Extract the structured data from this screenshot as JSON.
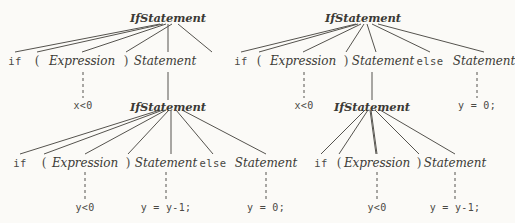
{
  "figure": {
    "background_color": "#fbfaf7",
    "ink_color": "#3b3a36",
    "line_color": "#55534e"
  },
  "trees": [
    {
      "id": "left-tree",
      "nodes": {
        "root": "IfStatement",
        "r1_if": "if",
        "r1_lparen": "(",
        "r1_expression": "Expression",
        "r1_rparen": ")",
        "r1_statement": "Statement",
        "r1_expr_leaf": "x<0",
        "inner_root": "IfStatement",
        "r2_if": "if",
        "r2_lparen": "(",
        "r2_expression": "Expression",
        "r2_rparen": ")",
        "r2_statement": "Statement",
        "r2_else": "else",
        "r2_statement2": "Statement",
        "r2_expr_leaf": "y<0",
        "r2_stmt_leaf": "y = y-1;",
        "r2_stmt2_leaf": "y = 0;"
      }
    },
    {
      "id": "right-tree",
      "nodes": {
        "root": "IfStatement",
        "r1_if": "if",
        "r1_lparen": "(",
        "r1_expression": "Expression",
        "r1_rparen": ")",
        "r1_statement": "Statement",
        "r1_else": "else",
        "r1_statement2": "Statement",
        "r1_expr_leaf": "x<0",
        "r1_stmt2_leaf": "y = 0;",
        "inner_root": "IfStatement",
        "r2_if": "if",
        "r2_lparen": "(",
        "r2_expression": "Expression",
        "r2_rparen": ")",
        "r2_statement": "Statement",
        "r2_expr_leaf": "y<0",
        "r2_stmt_leaf": "y = y-1;"
      }
    }
  ]
}
